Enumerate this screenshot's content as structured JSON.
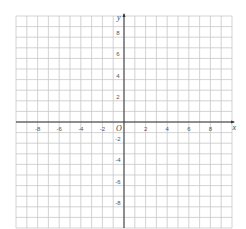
{
  "diagram": {
    "type": "cartesian-grid",
    "x_axis": {
      "label": "x",
      "min": -10,
      "max": 10,
      "tick_labels": [
        "-8",
        "-6",
        "-4",
        "-2",
        "2",
        "4",
        "6",
        "8"
      ],
      "tick_values": [
        -8,
        -6,
        -4,
        -2,
        2,
        4,
        6,
        8
      ]
    },
    "y_axis": {
      "label": "y",
      "min": -10,
      "max": 10,
      "tick_labels": [
        "8",
        "6",
        "4",
        "2",
        "-2",
        "-4",
        "-6",
        "-8"
      ],
      "tick_values": [
        8,
        6,
        4,
        2,
        -2,
        -4,
        -6,
        -8
      ]
    },
    "origin_label": "O",
    "grid_color": "#c8c8c8",
    "axis_color": "#333333"
  }
}
